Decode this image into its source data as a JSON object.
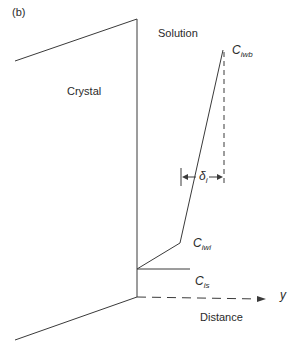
{
  "figure": {
    "panel_label": "(b)",
    "regions": {
      "crystal": "Crystal",
      "solution": "Solution"
    },
    "concentrations": {
      "bulk": {
        "main": "C",
        "sub": "iwb"
      },
      "interface": {
        "main": "C",
        "sub": "iwi"
      },
      "surface": {
        "main": "C",
        "sub": "is"
      }
    },
    "boundary_layer": {
      "main": "δ",
      "sub": "i"
    },
    "axis": {
      "symbol": "y",
      "label": "Distance"
    },
    "colors": {
      "line": "#3a3a3a",
      "background": "#ffffff"
    }
  }
}
